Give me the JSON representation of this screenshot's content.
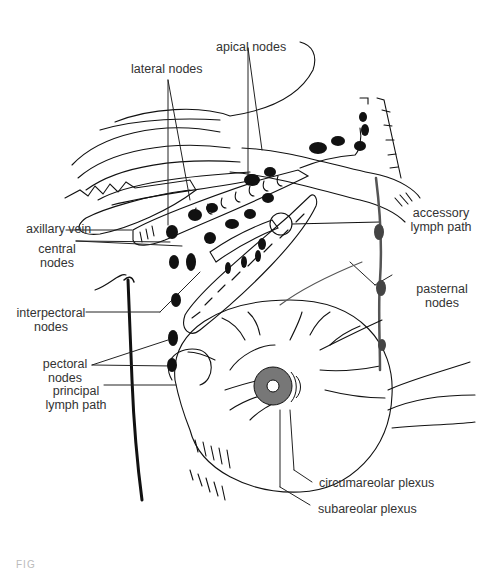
{
  "figure": {
    "caption_fragment": "FIG"
  },
  "labels": {
    "apical_nodes": "apical nodes",
    "lateral_nodes": "lateral nodes",
    "axillary_vein": "axillary vein",
    "central_nodes": [
      "central",
      "nodes"
    ],
    "interpectoral_nodes": [
      "interpectoral",
      "nodes"
    ],
    "pectoral_nodes": [
      "pectoral",
      "nodes"
    ],
    "principal_lymph_path": [
      "principal",
      "lymph path"
    ],
    "accessory_lymph_path": [
      "accessory",
      "lymph path"
    ],
    "pasternal_nodes": [
      "pasternal",
      "nodes"
    ],
    "circumareolar_plexus": "circumareolar plexus",
    "subareolar_plexus": "subareolar plexus"
  },
  "colors": {
    "ink": "#111111",
    "label_text": "#333333",
    "areola_fill": "#777777",
    "pasternal_node_fill": "#444444",
    "background": "#ffffff"
  }
}
